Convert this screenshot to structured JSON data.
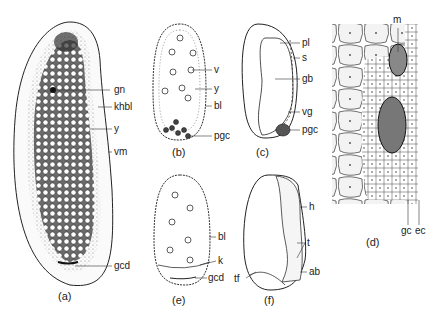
{
  "figure": {
    "panels": [
      {
        "id": "a",
        "caption": "(a)",
        "labels": [
          "gn",
          "khbl",
          "y",
          "vm",
          "gcd"
        ]
      },
      {
        "id": "b",
        "caption": "(b)",
        "labels": [
          "v",
          "y",
          "bl",
          "pgc"
        ]
      },
      {
        "id": "c",
        "caption": "(c)",
        "labels": [
          "pl",
          "s",
          "gb",
          "vg",
          "pgc"
        ]
      },
      {
        "id": "d",
        "caption": "(d)",
        "labels": [
          "m",
          "gc",
          "ec"
        ]
      },
      {
        "id": "e",
        "caption": "(e)",
        "labels": [
          "bl",
          "k",
          "gcd"
        ]
      },
      {
        "id": "f",
        "caption": "(f)",
        "labels": [
          "h",
          "t",
          "ab",
          "tf"
        ]
      }
    ]
  }
}
